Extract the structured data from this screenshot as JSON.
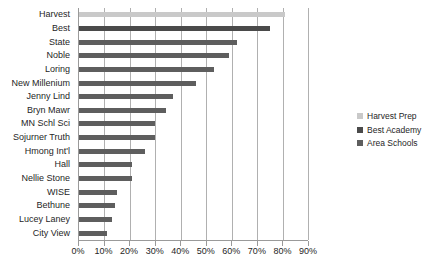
{
  "chart_data": {
    "type": "bar",
    "orientation": "horizontal",
    "title": "",
    "xlabel": "",
    "ylabel": "",
    "xlim": [
      0,
      90
    ],
    "grid": true,
    "legend_position": "right",
    "xticks": [
      "0%",
      "10%",
      "20%",
      "30%",
      "40%",
      "50%",
      "60%",
      "70%",
      "80%",
      "90%"
    ],
    "xtick_values": [
      0,
      10,
      20,
      30,
      40,
      50,
      60,
      70,
      80,
      90
    ],
    "categories": [
      "Harvest",
      "Best",
      "State",
      "Noble",
      "Loring",
      "New Millenium",
      "Jenny Lind",
      "Bryn Mawr",
      "MN Schl Sci",
      "Sojurner Truth",
      "Hmong Int'l",
      "Hall",
      "Nellie Stone",
      "WISE",
      "Bethune",
      "Lucey Laney",
      "City View"
    ],
    "values": [
      81,
      75,
      62,
      59,
      53,
      46,
      37,
      34,
      30,
      30,
      26,
      21,
      21,
      15,
      14,
      13,
      11
    ],
    "series_of": [
      "Harvest Prep",
      "Best Academy",
      "Area Schools",
      "Area Schools",
      "Area Schools",
      "Area Schools",
      "Area Schools",
      "Area Schools",
      "Area Schools",
      "Area Schools",
      "Area Schools",
      "Area Schools",
      "Area Schools",
      "Area Schools",
      "Area Schools",
      "Area Schools",
      "Area Schools"
    ],
    "legend": [
      {
        "label": "Harvest Prep",
        "color": "#c9c9c9"
      },
      {
        "label": "Best Academy",
        "color": "#4a4a4a"
      },
      {
        "label": "Area Schools",
        "color": "#5e5e5e"
      }
    ]
  }
}
